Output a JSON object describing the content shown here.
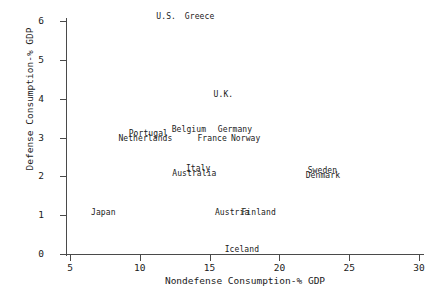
{
  "chart_data": {
    "type": "scatter",
    "title": "",
    "xlabel": "Nondefense Consumption-% GDP",
    "ylabel": "Defense Consumption-% GDP",
    "xlim": [
      5,
      30
    ],
    "ylim": [
      0,
      6
    ],
    "xticks": [
      5,
      10,
      15,
      20,
      25,
      30
    ],
    "yticks": [
      0,
      1,
      2,
      3,
      4,
      5,
      6
    ],
    "xtick_labels": [
      "5",
      "10",
      "15",
      "20",
      "25",
      "30"
    ],
    "ytick_labels": [
      "0",
      "1",
      "2",
      "3",
      "4",
      "5",
      "6"
    ],
    "grid": false,
    "legend": "none",
    "marker_style": "text-label",
    "points": [
      {
        "label": "U.S.",
        "x": 11.9,
        "y": 6.1
      },
      {
        "label": "Greece",
        "x": 14.3,
        "y": 6.1
      },
      {
        "label": "U.K.",
        "x": 16.0,
        "y": 4.1
      },
      {
        "label": "Portugal",
        "x": 10.6,
        "y": 3.1
      },
      {
        "label": "Belgium",
        "x": 13.5,
        "y": 3.2
      },
      {
        "label": "Germany",
        "x": 16.8,
        "y": 3.2
      },
      {
        "label": "Netherlands",
        "x": 10.4,
        "y": 2.95
      },
      {
        "label": "France",
        "x": 15.2,
        "y": 2.95
      },
      {
        "label": "Norway",
        "x": 17.6,
        "y": 2.95
      },
      {
        "label": "Italy",
        "x": 14.2,
        "y": 2.2
      },
      {
        "label": "Australia",
        "x": 13.9,
        "y": 2.05
      },
      {
        "label": "Sweden",
        "x": 23.1,
        "y": 2.15
      },
      {
        "label": "Denmark",
        "x": 23.1,
        "y": 2.0
      },
      {
        "label": "Japan",
        "x": 7.4,
        "y": 1.05
      },
      {
        "label": "Austria",
        "x": 16.6,
        "y": 1.05
      },
      {
        "label": "Finland",
        "x": 18.5,
        "y": 1.05
      },
      {
        "label": "Iceland",
        "x": 17.3,
        "y": 0.1
      }
    ]
  },
  "colors": {
    "axis": "#4a4a4a",
    "text": "#1a1a1a",
    "background": "#ffffff"
  }
}
